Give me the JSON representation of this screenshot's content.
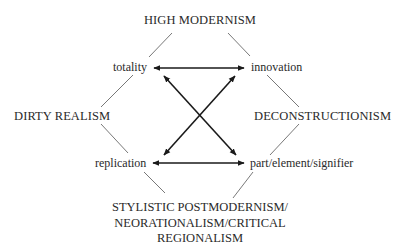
{
  "diagram": {
    "type": "semiotic-square",
    "corners": {
      "top": "HIGH MODERNISM",
      "left": "DIRTY REALISM",
      "right": "DECONSTRUCTIONISM",
      "bottom": {
        "lines": [
          "STYLISTIC POSTMODERNISM/",
          "NEORATIONALISM/CRITICAL",
          "REGIONALISM"
        ]
      }
    },
    "terms": {
      "top_left": "totality",
      "top_right": "innovation",
      "bottom_left": "replication",
      "bottom_right": "part/element/signifier"
    },
    "relations": [
      {
        "from": "totality",
        "to": "innovation",
        "type": "double-arrow"
      },
      {
        "from": "replication",
        "to": "part/element/signifier",
        "type": "double-arrow"
      },
      {
        "from": "totality",
        "to": "part/element/signifier",
        "type": "double-arrow"
      },
      {
        "from": "innovation",
        "to": "replication",
        "type": "double-arrow"
      },
      {
        "from": "HIGH MODERNISM",
        "to": "totality",
        "type": "line"
      },
      {
        "from": "HIGH MODERNISM",
        "to": "innovation",
        "type": "line"
      },
      {
        "from": "DIRTY REALISM",
        "to": "totality",
        "type": "line"
      },
      {
        "from": "DIRTY REALISM",
        "to": "replication",
        "type": "line"
      },
      {
        "from": "DECONSTRUCTIONISM",
        "to": "innovation",
        "type": "line"
      },
      {
        "from": "DECONSTRUCTIONISM",
        "to": "part/element/signifier",
        "type": "line"
      },
      {
        "from": "STYLISTIC POSTMODERNISM/NEORATIONALISM/CRITICAL REGIONALISM",
        "to": "replication",
        "type": "line"
      },
      {
        "from": "STYLISTIC POSTMODERNISM/NEORATIONALISM/CRITICAL REGIONALISM",
        "to": "part/element/signifier",
        "type": "line"
      }
    ],
    "colors": {
      "text": "#2a2a2a",
      "arrow": "#1a1a1a",
      "line": "#555555",
      "background": "#ffffff"
    }
  }
}
